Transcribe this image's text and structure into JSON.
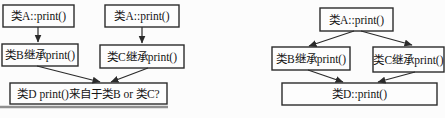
{
  "figure": {
    "left_diagram": {
      "nodes": {
        "a1": "类A::print()",
        "a2": "类A::print()",
        "b": "类B继承print()",
        "c": "类C继承print()",
        "d": "类D print()来自于类B or 类C?"
      },
      "edges": [
        "a1->b",
        "a2->c",
        "b->d",
        "c->d"
      ]
    },
    "right_diagram": {
      "nodes": {
        "a": "类A::print()",
        "b": "类B继承print()",
        "c": "类C继承print()",
        "d": "类D::print()"
      },
      "edges": [
        "a->b",
        "a->c",
        "b->d",
        "c->d"
      ]
    },
    "colors": {
      "stroke": "#2b2b2b",
      "text": "#141414",
      "background": "#fcfcfc",
      "artifact_line": "#8f8f8f"
    }
  }
}
